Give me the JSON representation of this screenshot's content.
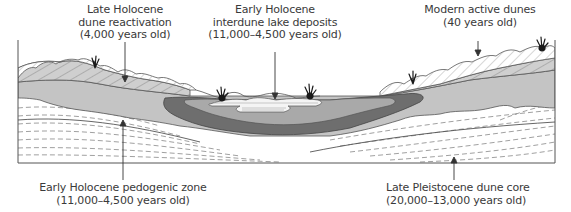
{
  "diagram": {
    "type": "geologic-cross-section"
  },
  "labels": {
    "late_holocene": {
      "line1": "Late Holocene",
      "line2": "dune reactivation",
      "line3": "(4,000 years old)"
    },
    "early_holocene_lake": {
      "line1": "Early Holocene",
      "line2": "interdune lake deposits",
      "line3": "(11,000–4,500 years old)"
    },
    "modern_dunes": {
      "line1": "Modern active dunes",
      "line2": "(40 years old)"
    },
    "pedogenic_zone": {
      "line1": "Early Holocene pedogenic zone",
      "line2": "(11,000–4,500 years old)"
    },
    "pleistocene_core": {
      "line1": "Late Pleistocene dune core",
      "line2": "(20,000–13,000 years old)"
    }
  },
  "colors": {
    "modern_dune_fill": "#ffffff",
    "reactivation_fill": "#cfcfcf",
    "pedogenic_fill": "#c4c4c4",
    "lake_dark_fill": "#6e6e6e",
    "lake_mid_fill": "#a9a9a9",
    "lake_light_fill": "#f4f4f4",
    "pleistocene_fill": "#ffffff",
    "outline": "#4a4a4a",
    "vegetation": "#1a1a1a"
  }
}
